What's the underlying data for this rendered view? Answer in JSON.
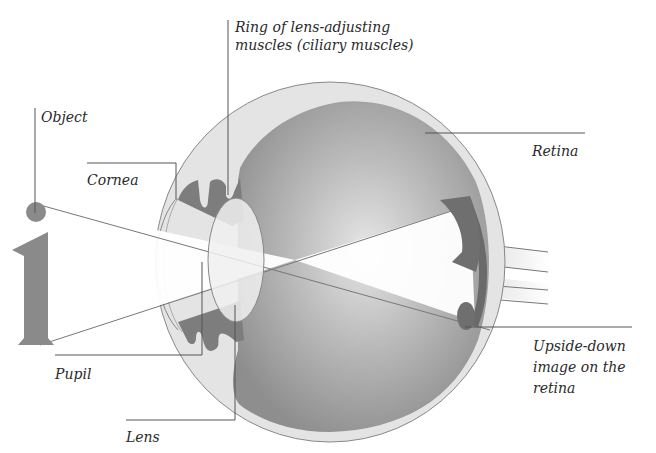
{
  "diagram": {
    "labels": {
      "object": "Object",
      "cornea": "Cornea",
      "ciliary": "Ring of lens-adjusting\nmuscles (ciliary muscles)",
      "retina": "Retina",
      "pupil": "Pupil",
      "lens": "Lens",
      "image": "Upside-down\nimage on the\nretina"
    },
    "colors": {
      "background": "#ffffff",
      "sclera": "#e4e4e4",
      "interior": "#9a9a9a",
      "interior_light": "#d8d8d8",
      "iris": "#7d7d7d",
      "object": "#8a8a8a",
      "image": "#6f6f6f",
      "leader_line": "#555555",
      "text": "#2a2a2a"
    }
  }
}
